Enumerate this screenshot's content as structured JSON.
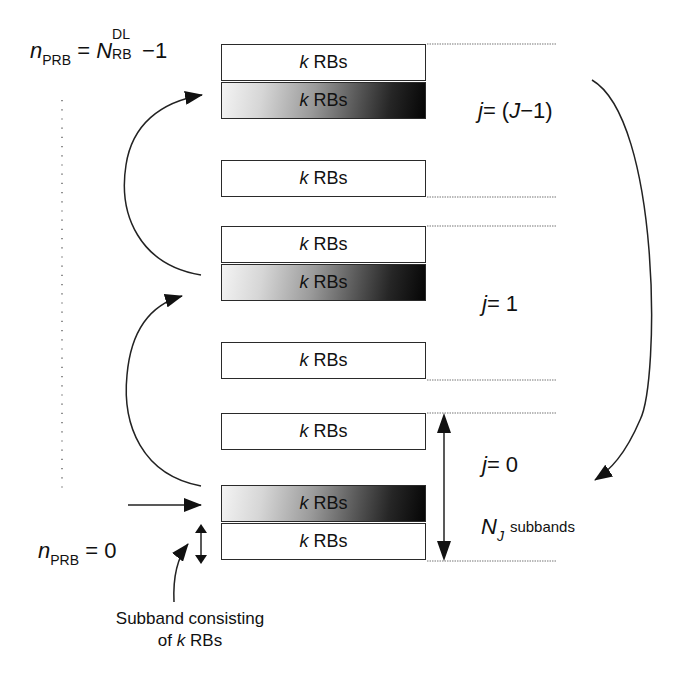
{
  "diagram": {
    "type": "frequency-selective subband allocation (PRB subbands)",
    "labels": {
      "top_index_var": "n",
      "top_index_sub": "PRB",
      "top_index_eq": "=",
      "top_index_N": "N",
      "top_index_N_sup": "DL",
      "top_index_N_sub": "RB",
      "top_index_tail": "−1",
      "bottom_index_var": "n",
      "bottom_index_sub": "PRB",
      "bottom_index_value": "= 0",
      "group_top": "j = (J−1)",
      "group_top_j": "j",
      "group_top_rest": "= (",
      "group_top_J": "J",
      "group_top_end": "−1)",
      "group_mid_j": "j",
      "group_mid_rest": "= 1",
      "group_bottom_j": "j",
      "group_bottom_rest": "= 0",
      "nj_symbol": "N",
      "nj_sub": "J",
      "nj_text": "subbands",
      "caption_line1": "Subband consisting",
      "caption_of": "of",
      "caption_k": "k",
      "caption_rbs": "RBs"
    },
    "boxes": [
      {
        "k": "k",
        "text": "RBs",
        "shaded": false,
        "group": "j=(J-1)"
      },
      {
        "k": "k",
        "text": "RBs",
        "shaded": true,
        "group": "j=(J-1)"
      },
      {
        "k": "k",
        "text": "RBs",
        "shaded": false,
        "group": "between"
      },
      {
        "k": "k",
        "text": "RBs",
        "shaded": false,
        "group": "j=1"
      },
      {
        "k": "k",
        "text": "RBs",
        "shaded": true,
        "group": "j=1"
      },
      {
        "k": "k",
        "text": "RBs",
        "shaded": false,
        "group": "between"
      },
      {
        "k": "k",
        "text": "RBs",
        "shaded": false,
        "group": "j=0"
      },
      {
        "k": "k",
        "text": "RBs",
        "shaded": true,
        "group": "j=0"
      },
      {
        "k": "k",
        "text": "RBs",
        "shaded": false,
        "group": "j=0"
      }
    ],
    "colors": {
      "line": "#222222",
      "dotted": "#777777",
      "gradient_light": "#f4f4f4",
      "gradient_dark": "#050505"
    }
  }
}
